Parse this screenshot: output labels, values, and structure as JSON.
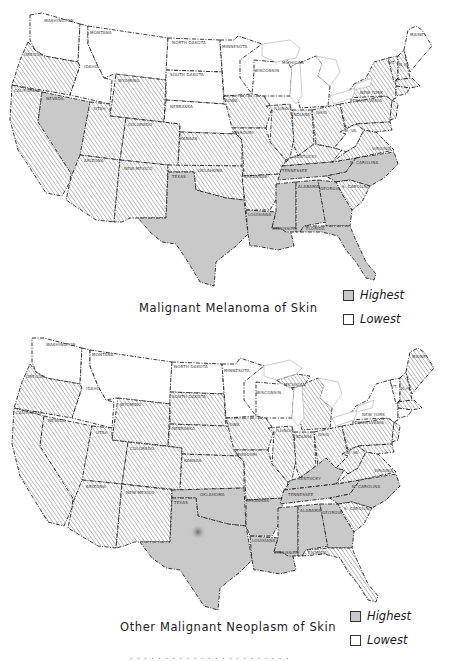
{
  "colors": {
    "highest": "#c9c9c9",
    "intermediate_hatch": "#555555",
    "lowest": "#ffffff",
    "border": "#222222"
  },
  "legend": {
    "highest_label": "Highest",
    "lowest_label": "Lowest"
  },
  "maps": [
    {
      "title": "Malignant Melanoma of Skin",
      "highest_states": [
        "Nevada",
        "Texas",
        "Louisiana",
        "Mississippi",
        "Alabama",
        "Georgia",
        "Florida",
        "Tennessee",
        "North Carolina"
      ],
      "intermediate_states": [
        "Washington (coast)",
        "Oregon",
        "California",
        "Utah",
        "Arizona",
        "Wyoming",
        "Colorado",
        "New Mexico",
        "Kansas",
        "Oklahoma",
        "Iowa",
        "Missouri",
        "Arkansas",
        "Illinois",
        "Indiana",
        "Ohio",
        "Kentucky",
        "Virginia",
        "South Carolina",
        "Pennsylvania",
        "New York",
        "Vermont",
        "New Hampshire",
        "Massachusetts",
        "Connecticut",
        "New Jersey",
        "Maryland"
      ],
      "lowest_states": [
        "Washington",
        "Idaho",
        "Montana",
        "North Dakota",
        "South Dakota",
        "Nebraska",
        "Minnesota",
        "Wisconsin",
        "Michigan",
        "West Virginia",
        "Maine"
      ]
    },
    {
      "title": "Other Malignant Neoplasm of Skin",
      "highest_states": [
        "Texas",
        "Oklahoma",
        "Arkansas",
        "Louisiana",
        "Mississippi",
        "Alabama",
        "Georgia",
        "Tennessee",
        "Kentucky",
        "North Carolina"
      ],
      "intermediate_states": [
        "Oregon",
        "California",
        "Nevada",
        "Utah",
        "Arizona",
        "Wyoming",
        "Colorado",
        "New Mexico",
        "South Dakota",
        "Nebraska",
        "Kansas",
        "Iowa",
        "Missouri",
        "Illinois",
        "Indiana",
        "Ohio",
        "Michigan",
        "West Virginia",
        "Virginia",
        "South Carolina",
        "Florida",
        "Pennsylvania",
        "Maine",
        "New Hampshire",
        "Massachusetts",
        "New Jersey",
        "Maryland"
      ],
      "lowest_states": [
        "Washington",
        "Idaho",
        "Montana",
        "North Dakota",
        "Minnesota",
        "Wisconsin",
        "New York",
        "Vermont"
      ]
    }
  ],
  "state_labels": {
    "wa": "WASHINGTON",
    "or": "OREGON",
    "ca": "CALIFORNIA",
    "nv": "NEVADA",
    "id": "IDAHO",
    "mt": "MONTANA",
    "wy": "WYOMING",
    "ut": "UTAH",
    "az": "ARIZONA",
    "co": "COLORADO",
    "nm": "NEW MEXICO",
    "nd": "NORTH DAKOTA",
    "sd": "SOUTH DAKOTA",
    "ne": "NEBRASKA",
    "ks": "KANSAS",
    "ok": "OKLAHOMA",
    "tx": "TEXAS",
    "mn": "MINNESOTA",
    "ia": "IOWA",
    "mo": "MISSOURI",
    "ar": "ARKANSAS",
    "la": "LOUISIANA",
    "wi": "WISCONSIN",
    "il": "ILLINOIS",
    "mi": "MICHIGAN",
    "in": "INDIANA",
    "oh": "OHIO",
    "ky": "KENTUCKY",
    "tn": "TENNESSEE",
    "ms": "MISSISSIPPI",
    "al": "ALABAMA",
    "ga": "GEORGIA",
    "fl": "FLORIDA",
    "sc": "S. CAROLINA",
    "nc": "N. CAROLINA",
    "va": "VIRGINIA",
    "wv": "W. VA.",
    "pa": "PENNSYLVANIA",
    "ny": "NEW YORK",
    "me": "MAINE",
    "vt": "VT.",
    "nh": "N.H."
  },
  "footer": {
    "partial_caption": "· · ·   · ·  · ·   · ·   · · ·   · · ·  ·  · · ·  ·  · · ·"
  }
}
